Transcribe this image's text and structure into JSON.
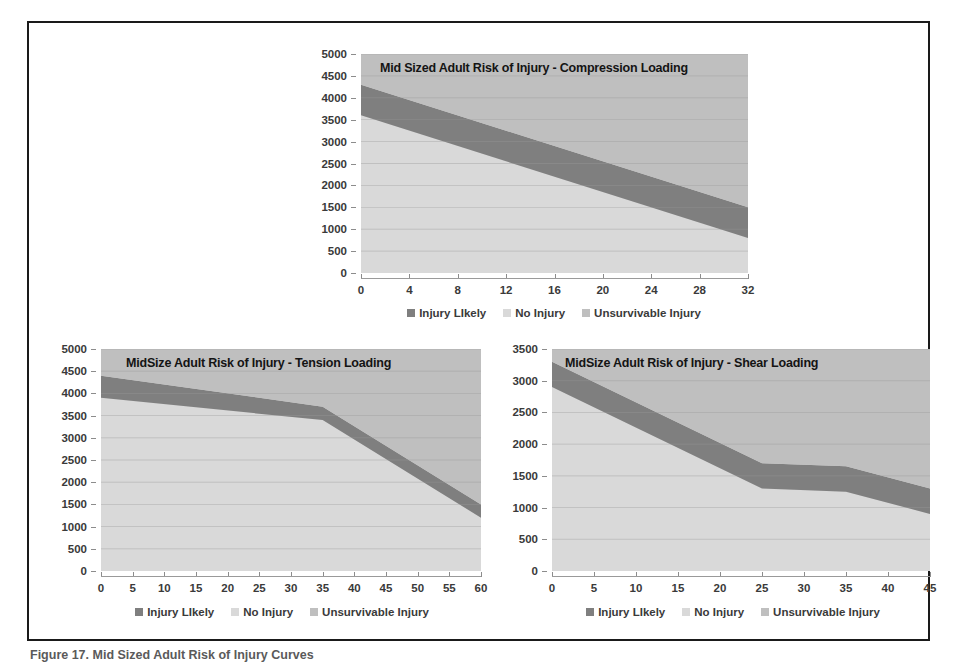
{
  "figure": {
    "caption": "Figure 17. Mid Sized Adult Risk of Injury Curves"
  },
  "legend": {
    "items": [
      {
        "label": "Injury LIkely",
        "color": "#7f7f7f"
      },
      {
        "label": "No Injury",
        "color": "#d9d9d9"
      },
      {
        "label": "Unsurvivable Injury",
        "color": "#bfbfbf"
      }
    ]
  },
  "colors": {
    "no_injury": "#d9d9d9",
    "injury_likely": "#7f7f7f",
    "unsurvivable": "#bfbfbf",
    "plot_background": "#d2d2d2",
    "gridline": "#9a9a9a",
    "frame": "#1a1a1a"
  },
  "chart_data": [
    {
      "id": "compression",
      "type": "area",
      "title": "Mid Sized Adult Risk of Injury - Compression Loading",
      "xlabel": "",
      "ylabel": "",
      "xlim": [
        0,
        32
      ],
      "ylim": [
        0,
        5000
      ],
      "xticks": [
        0,
        4,
        8,
        12,
        16,
        20,
        24,
        28,
        32
      ],
      "yticks": [
        0,
        500,
        1000,
        1500,
        2000,
        2500,
        3000,
        3500,
        4000,
        4500,
        5000
      ],
      "grid": true,
      "legend_position": "bottom",
      "x": [
        0,
        32
      ],
      "series": [
        {
          "name": "No Injury",
          "values": [
            3600,
            800
          ]
        },
        {
          "name": "Injury Likely",
          "values": [
            4300,
            1500
          ]
        },
        {
          "name": "Unsurvivable Injury",
          "values": [
            5000,
            5000
          ]
        }
      ]
    },
    {
      "id": "tension",
      "type": "area",
      "title": "MidSize Adult Risk of Injury - Tension Loading",
      "xlabel": "",
      "ylabel": "",
      "xlim": [
        0,
        60
      ],
      "ylim": [
        0,
        5000
      ],
      "xticks": [
        0,
        5,
        10,
        15,
        20,
        25,
        30,
        35,
        40,
        45,
        50,
        55,
        60
      ],
      "yticks": [
        0,
        500,
        1000,
        1500,
        2000,
        2500,
        3000,
        3500,
        4000,
        4500,
        5000
      ],
      "grid": true,
      "legend_position": "bottom",
      "x": [
        0,
        35,
        60
      ],
      "series": [
        {
          "name": "No Injury",
          "values": [
            3900,
            3400,
            1200
          ]
        },
        {
          "name": "Injury Likely",
          "values": [
            4400,
            3700,
            1500
          ]
        },
        {
          "name": "Unsurvivable Injury",
          "values": [
            5000,
            5000,
            5000
          ]
        }
      ]
    },
    {
      "id": "shear",
      "type": "area",
      "title": "MidSize Adult Risk of Injury - Shear Loading",
      "xlabel": "",
      "ylabel": "",
      "xlim": [
        0,
        45
      ],
      "ylim": [
        0,
        3500
      ],
      "xticks": [
        0,
        5,
        10,
        15,
        20,
        25,
        30,
        35,
        40,
        45
      ],
      "yticks": [
        0,
        500,
        1000,
        1500,
        2000,
        2500,
        3000,
        3500
      ],
      "grid": true,
      "legend_position": "bottom",
      "x": [
        0,
        25,
        35,
        45
      ],
      "series": [
        {
          "name": "No Injury",
          "values": [
            2900,
            1300,
            1250,
            900
          ]
        },
        {
          "name": "Injury Likely",
          "values": [
            3300,
            1700,
            1650,
            1300
          ]
        },
        {
          "name": "Unsurvivable Injury",
          "values": [
            3500,
            3500,
            3500,
            3500
          ]
        }
      ]
    }
  ]
}
